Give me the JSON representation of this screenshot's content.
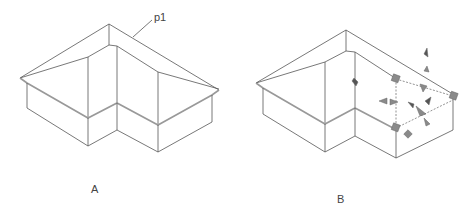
{
  "figures": [
    {
      "id": "A",
      "caption": "A",
      "callout": "p1"
    },
    {
      "id": "B",
      "caption": "B"
    }
  ],
  "colors": {
    "line": "#555555",
    "eave": "#999999",
    "grip": "#8a8a8a",
    "grip_dark": "#555555"
  }
}
